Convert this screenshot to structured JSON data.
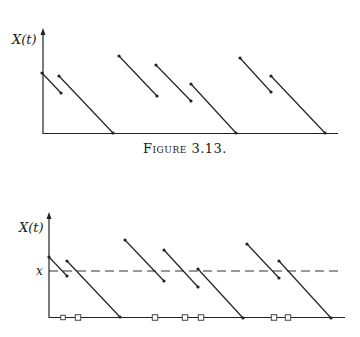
{
  "caption": "Figure 3.13.",
  "chart_data": [
    {
      "type": "line",
      "title": "",
      "ylabel": "X(t)",
      "xlabel": "",
      "description": "Sawtooth-like piecewise linear process: jumps up then decreases linearly with slope -1 until next jump or reaching 0",
      "axes": {
        "origin": [
          43,
          133
        ],
        "y_top": 30,
        "x_right": 338
      },
      "segments": [
        {
          "from": [
            42,
            73
          ],
          "to": [
            61,
            93
          ]
        },
        {
          "from": [
            59,
            76
          ],
          "to": [
            113,
            133
          ]
        },
        {
          "from": [
            119,
            56
          ],
          "to": [
            157,
            96
          ]
        },
        {
          "from": [
            156,
            65
          ],
          "to": [
            191,
            101
          ]
        },
        {
          "from": [
            191,
            84
          ],
          "to": [
            236,
            133
          ]
        },
        {
          "from": [
            240,
            58
          ],
          "to": [
            271,
            92
          ]
        },
        {
          "from": [
            271,
            76
          ],
          "to": [
            325,
            133
          ]
        }
      ]
    },
    {
      "type": "line",
      "title": "",
      "ylabel": "X(t)",
      "xlabel": "",
      "threshold_label": "x",
      "threshold_y": 271,
      "axes": {
        "origin": [
          49,
          317
        ],
        "y_top": 214,
        "x_right": 345
      },
      "segments": [
        {
          "from": [
            49,
            257
          ],
          "to": [
            67,
            276
          ]
        },
        {
          "from": [
            67,
            261
          ],
          "to": [
            120,
            317
          ]
        },
        {
          "from": [
            125,
            240
          ],
          "to": [
            164,
            281
          ]
        },
        {
          "from": [
            164,
            250
          ],
          "to": [
            198,
            287
          ]
        },
        {
          "from": [
            198,
            269
          ],
          "to": [
            243,
            318
          ]
        },
        {
          "from": [
            247,
            244
          ],
          "to": [
            279,
            278
          ]
        },
        {
          "from": [
            279,
            261
          ],
          "to": [
            331,
            318
          ]
        }
      ],
      "baseline_markers_x": [
        63,
        78,
        155,
        185,
        201,
        274,
        288
      ],
      "marker_shape": "open-square"
    }
  ]
}
